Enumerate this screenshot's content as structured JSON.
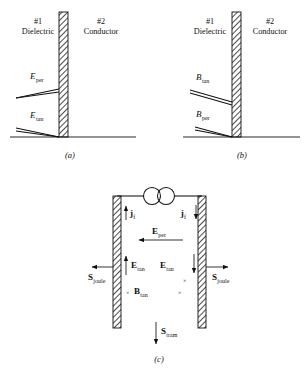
{
  "figure": {
    "caption_a": "(a)",
    "caption_b": "(b)",
    "caption_c": "(c)"
  },
  "panel_a": {
    "region1_number": "#1",
    "region1_name": "Dielectric",
    "region2_number": "#2",
    "region2_name": "Conductor",
    "field_upper_symbol": "E",
    "field_upper_sub": "per",
    "field_lower_symbol": "E",
    "field_lower_sub": "tan"
  },
  "panel_b": {
    "region1_number": "#1",
    "region1_name": "Dielectric",
    "region2_number": "#2",
    "region2_name": "Conductor",
    "field_upper_symbol": "B",
    "field_upper_sub": "tan",
    "field_lower_symbol": "B",
    "field_lower_sub": "per"
  },
  "panel_c": {
    "current_left_symbol": "j",
    "current_left_sub": "f",
    "current_right_symbol": "j",
    "current_right_sub": "f",
    "e_per_symbol": "E",
    "e_per_sub": "per",
    "e_tan_left_symbol": "E",
    "e_tan_left_sub": "tan",
    "e_tan_right_symbol": "E",
    "e_tan_right_sub": "tan",
    "b_tan_symbol": "B",
    "b_tan_sub": "tan",
    "s_joule_left_symbol": "S",
    "s_joule_left_sub": "joule",
    "s_joule_right_symbol": "S",
    "s_joule_right_sub": "joule",
    "s_tram_symbol": "S",
    "s_tram_sub": "tram",
    "field_into_page_marker": "×",
    "source_label": ""
  },
  "colors": {
    "ink": "#111111",
    "background": "#ffffff"
  }
}
